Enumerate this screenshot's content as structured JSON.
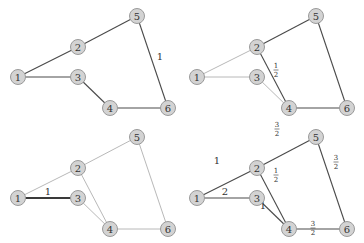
{
  "figure": {
    "nodes": [
      {
        "id": "1",
        "x": 18,
        "y": 77
      },
      {
        "id": "2",
        "x": 78,
        "y": 47
      },
      {
        "id": "3",
        "x": 78,
        "y": 77
      },
      {
        "id": "4",
        "x": 110,
        "y": 108
      },
      {
        "id": "5",
        "x": 137,
        "y": 16
      },
      {
        "id": "6",
        "x": 168,
        "y": 108
      }
    ],
    "panels": [
      {
        "name": "top-left",
        "offset": [
          0,
          0
        ],
        "edges": [
          {
            "from": "1",
            "to": "2",
            "style": "dark"
          },
          {
            "from": "2",
            "to": "5",
            "style": "dark"
          },
          {
            "from": "5",
            "to": "6",
            "style": "dark"
          },
          {
            "from": "1",
            "to": "3",
            "style": "dark"
          },
          {
            "from": "3",
            "to": "4",
            "style": "dark"
          },
          {
            "from": "4",
            "to": "6",
            "style": "dark"
          }
        ],
        "labels": [
          {
            "text": "1",
            "x": 160,
            "y": 56
          }
        ]
      },
      {
        "name": "top-right",
        "offset": [
          179,
          0
        ],
        "edges": [
          {
            "from": "1",
            "to": "2",
            "style": "light"
          },
          {
            "from": "1",
            "to": "3",
            "style": "light"
          },
          {
            "from": "3",
            "to": "4",
            "style": "light"
          },
          {
            "from": "2",
            "to": "5",
            "style": "dark"
          },
          {
            "from": "2",
            "to": "4",
            "style": "dark"
          },
          {
            "from": "5",
            "to": "6",
            "style": "dark"
          },
          {
            "from": "4",
            "to": "6",
            "style": "dark"
          }
        ],
        "fractions": [
          {
            "num": "1",
            "den": "2",
            "x": 97,
            "y": 67
          }
        ]
      },
      {
        "name": "bottom-left",
        "offset": [
          0,
          121
        ],
        "edges": [
          {
            "from": "1",
            "to": "2",
            "style": "light"
          },
          {
            "from": "2",
            "to": "5",
            "style": "light"
          },
          {
            "from": "5",
            "to": "6",
            "style": "light"
          },
          {
            "from": "2",
            "to": "4",
            "style": "light"
          },
          {
            "from": "3",
            "to": "4",
            "style": "light"
          },
          {
            "from": "4",
            "to": "6",
            "style": "light"
          },
          {
            "from": "1",
            "to": "3",
            "style": "bold"
          }
        ],
        "labels": [
          {
            "text": "1",
            "x": 48,
            "y": 70
          }
        ]
      },
      {
        "name": "bottom-right",
        "offset": [
          179,
          121
        ],
        "edges": [
          {
            "from": "1",
            "to": "2",
            "style": "dark"
          },
          {
            "from": "2",
            "to": "5",
            "style": "dark"
          },
          {
            "from": "5",
            "to": "6",
            "style": "dark"
          },
          {
            "from": "1",
            "to": "3",
            "style": "dark"
          },
          {
            "from": "2",
            "to": "4",
            "style": "dark"
          },
          {
            "from": "3",
            "to": "4",
            "style": "dark"
          },
          {
            "from": "4",
            "to": "6",
            "style": "dark"
          }
        ],
        "labels": [
          {
            "text": "1",
            "x": 38,
            "y": 39
          },
          {
            "text": "2",
            "x": 46,
            "y": 70
          },
          {
            "text": "1",
            "x": 84,
            "y": 84
          }
        ],
        "fractions": [
          {
            "num": "3",
            "den": "2",
            "x": 98,
            "y": 5
          },
          {
            "num": "1",
            "den": "2",
            "x": 97,
            "y": 51
          },
          {
            "num": "3",
            "den": "2",
            "x": 157,
            "y": 38
          },
          {
            "num": "3",
            "den": "2",
            "x": 134,
            "y": 104
          }
        ]
      }
    ]
  }
}
